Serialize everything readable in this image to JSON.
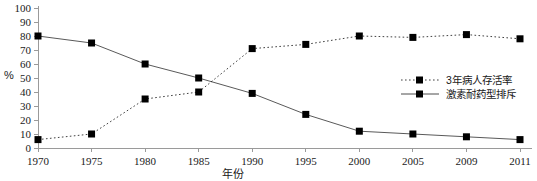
{
  "chart_data": {
    "type": "line",
    "title": "",
    "xlabel": "年份",
    "ylabel": "%",
    "x": [
      "1970",
      "1975",
      "1980",
      "1985",
      "1990",
      "1995",
      "2000",
      "2005",
      "2009",
      "2011"
    ],
    "ylim": [
      0,
      100
    ],
    "yticks": [
      "0",
      "10",
      "20",
      "30",
      "40",
      "50",
      "60",
      "70",
      "80",
      "90",
      "100"
    ],
    "grid": false,
    "legend_position": "center-right",
    "series": [
      {
        "name": "3年病人存活率",
        "style": "dotted",
        "marker": "square",
        "color": "#000000",
        "values": [
          6,
          10,
          35,
          40,
          71,
          74,
          80,
          79,
          81,
          78
        ]
      },
      {
        "name": "激素耐药型排斥",
        "style": "solid",
        "marker": "square",
        "color": "#000000",
        "values": [
          80,
          75,
          60,
          50,
          39,
          24,
          12,
          10,
          8,
          6
        ]
      }
    ]
  }
}
